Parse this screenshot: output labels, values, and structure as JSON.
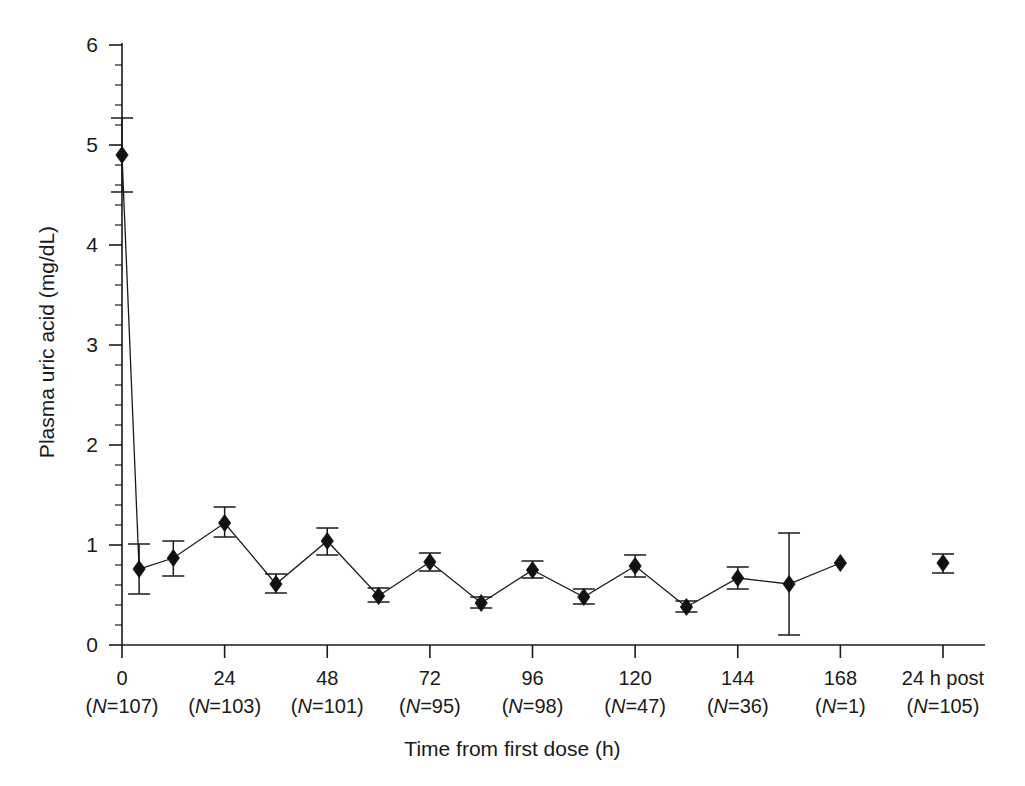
{
  "chart_data": {
    "type": "line",
    "title": "",
    "xlabel": "Time from first dose (h)",
    "ylabel": "Plasma uric acid (mg/dL)",
    "xlim": [
      -3,
      195
    ],
    "ylim": [
      0,
      6
    ],
    "grid": false,
    "legend": "none",
    "y_ticks": [
      "0",
      "1",
      "2",
      "3",
      "4",
      "5",
      "6"
    ],
    "y_tick_values": [
      0,
      1,
      2,
      3,
      4,
      5,
      6
    ],
    "y_minor_interval": 0.2,
    "x_ticks": [
      "0",
      "24",
      "48",
      "72",
      "96",
      "120",
      "144",
      "168",
      "24 h post"
    ],
    "x_tick_values": [
      0,
      24,
      48,
      72,
      96,
      120,
      144,
      168,
      192
    ],
    "x_tick_sublabels": [
      "(N=107)",
      "(N=103)",
      "(N=101)",
      "(N=95)",
      "(N=98)",
      "(N=47)",
      "(N=36)",
      "(N=1)",
      "(N=105)"
    ],
    "n_values": [
      107,
      103,
      101,
      95,
      98,
      47,
      36,
      1,
      105
    ],
    "error_type": "error bars (upper and lower)",
    "series": [
      {
        "name": "Plasma uric acid",
        "marker": "filled-diamond",
        "color": "#111111",
        "connected": true,
        "x": [
          0,
          4,
          12,
          24,
          36,
          48,
          60,
          72,
          84,
          96,
          108,
          120,
          132,
          144,
          156,
          168
        ],
        "values": [
          4.9,
          0.76,
          0.87,
          1.22,
          0.61,
          1.04,
          0.49,
          0.83,
          0.42,
          0.75,
          0.48,
          0.79,
          0.38,
          0.67,
          0.61,
          0.82
        ],
        "err_low": [
          4.53,
          0.51,
          0.69,
          1.08,
          0.52,
          0.9,
          0.43,
          0.74,
          0.37,
          0.67,
          0.41,
          0.68,
          0.33,
          0.56,
          0.1,
          null
        ],
        "err_high": [
          5.27,
          1.01,
          1.04,
          1.38,
          0.71,
          1.17,
          0.57,
          0.92,
          0.48,
          0.84,
          0.56,
          0.9,
          0.44,
          0.78,
          1.12,
          null
        ]
      },
      {
        "name": "24 h post dose",
        "marker": "filled-diamond",
        "color": "#111111",
        "connected": false,
        "x": [
          192
        ],
        "values": [
          0.82
        ],
        "err_low": [
          0.72
        ],
        "err_high": [
          0.91
        ]
      }
    ]
  },
  "axes": {
    "y_title": "Plasma uric acid (mg/dL)",
    "x_title": "Time from first dose (h)"
  }
}
